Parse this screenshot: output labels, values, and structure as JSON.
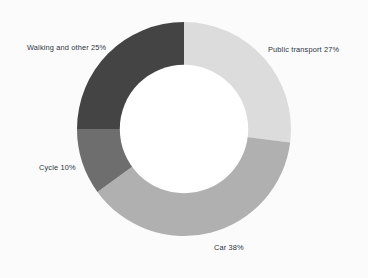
{
  "chart_data": {
    "type": "pie",
    "variant": "donut",
    "title": "",
    "xlabel": "",
    "ylabel": "",
    "units": "percent",
    "total": 100,
    "legend_position": "none",
    "labels_position": "outside",
    "grid": false,
    "start_angle_deg": 0,
    "direction": "clockwise",
    "inner_radius_ratio": 0.6,
    "categories": [
      "Public transport",
      "Car",
      "Cycle",
      "Walking and other"
    ],
    "values": [
      27,
      38,
      10,
      25
    ],
    "colors": [
      "#dcdcdc",
      "#b0b0b0",
      "#6e6e6e",
      "#444444"
    ],
    "slices": [
      {
        "name": "public-transport",
        "category": "Public transport",
        "value": 27,
        "label": "Public transport 27%",
        "color": "#dcdcdc",
        "start_deg": 0,
        "end_deg": 97.2
      },
      {
        "name": "car",
        "category": "Car",
        "value": 38,
        "label": "Car 38%",
        "color": "#b0b0b0",
        "start_deg": 97.2,
        "end_deg": 234.0
      },
      {
        "name": "cycle",
        "category": "Cycle",
        "value": 10,
        "label": "Cycle 10%",
        "color": "#6e6e6e",
        "start_deg": 234.0,
        "end_deg": 270.0
      },
      {
        "name": "walking-and-other",
        "category": "Walking and other",
        "value": 25,
        "label": "Walking and other 25%",
        "color": "#444444",
        "start_deg": 270.0,
        "end_deg": 360.0
      }
    ]
  },
  "canvas": {
    "background": "#fbfbfb",
    "hole_color": "#ffffff",
    "label_color": "#2c3340"
  }
}
